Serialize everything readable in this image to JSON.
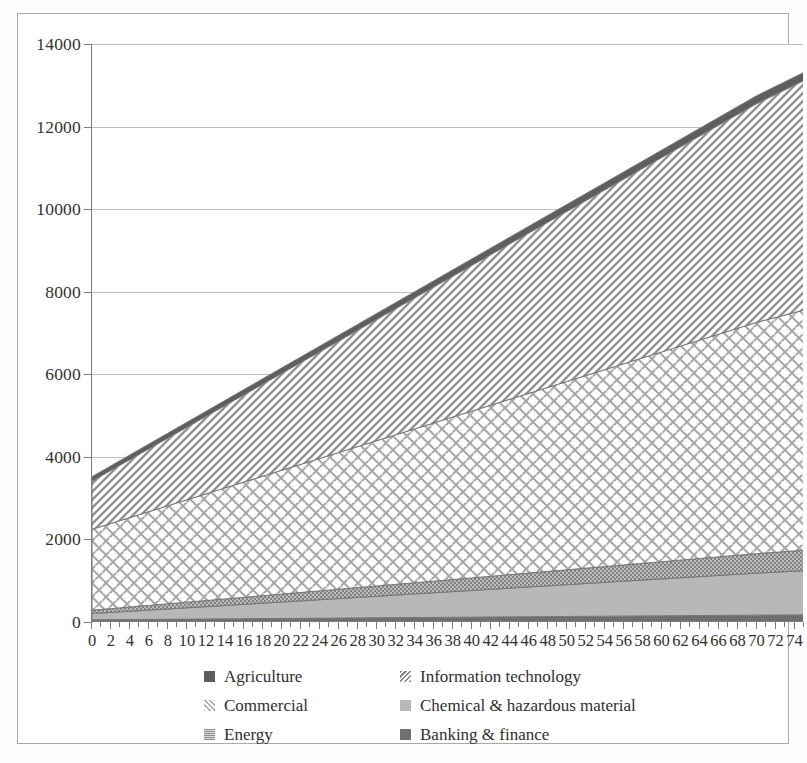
{
  "chart_data": {
    "type": "area",
    "title": "",
    "xlabel": "",
    "ylabel": "",
    "stacked": true,
    "grid": true,
    "legend_position": "bottom",
    "xlim": [
      0,
      75
    ],
    "ylim": [
      0,
      14000
    ],
    "y_ticks": [
      0,
      2000,
      4000,
      6000,
      8000,
      10000,
      12000,
      14000
    ],
    "x_ticks": [
      0,
      2,
      4,
      6,
      8,
      10,
      12,
      14,
      16,
      18,
      20,
      22,
      24,
      26,
      28,
      30,
      32,
      34,
      36,
      38,
      40,
      42,
      44,
      46,
      48,
      50,
      52,
      54,
      56,
      58,
      60,
      62,
      64,
      66,
      68,
      70,
      72,
      74
    ],
    "x": [
      0,
      5,
      10,
      15,
      20,
      25,
      30,
      35,
      40,
      45,
      50,
      55,
      60,
      65,
      70,
      75
    ],
    "series": [
      {
        "name": "Banking & finance",
        "pattern": "solid-dark",
        "color": "#6f6f71",
        "values": [
          55,
          62,
          70,
          78,
          86,
          94,
          102,
          110,
          118,
          126,
          134,
          142,
          150,
          158,
          166,
          172
        ]
      },
      {
        "name": "Chemical & hazardous material",
        "pattern": "solid-light",
        "color": "#b8b8ba",
        "values": [
          150,
          212,
          274,
          336,
          398,
          460,
          522,
          584,
          646,
          708,
          770,
          832,
          894,
          956,
          1018,
          1070
        ]
      },
      {
        "name": "Energy",
        "pattern": "fine-dots",
        "color": "#8d8d8f",
        "values": [
          80,
          108,
          136,
          164,
          192,
          220,
          248,
          276,
          304,
          332,
          360,
          388,
          416,
          444,
          472,
          495
        ]
      },
      {
        "name": "Commercial",
        "pattern": "basketweave",
        "color": "#9a9a9c",
        "values": [
          1960,
          2220,
          2480,
          2740,
          3000,
          3260,
          3520,
          3780,
          4040,
          4300,
          4560,
          4820,
          5080,
          5340,
          5600,
          5820
        ]
      },
      {
        "name": "Information technology",
        "pattern": "diagonal-hatch",
        "color": "#888889",
        "values": [
          1170,
          1465,
          1760,
          2055,
          2350,
          2645,
          2940,
          3235,
          3530,
          3825,
          4120,
          4415,
          4710,
          5005,
          5300,
          5560
        ]
      },
      {
        "name": "Agriculture",
        "pattern": "solid-darkest",
        "color": "#5e5e60",
        "values": [
          105,
          112,
          118,
          124,
          130,
          136,
          142,
          148,
          154,
          160,
          166,
          172,
          178,
          184,
          190,
          195
        ]
      }
    ],
    "stack_totals": [
      3520,
      4179,
      4838,
      5497,
      6156,
      6815,
      7474,
      8133,
      8792,
      9451,
      10110,
      10769,
      11428,
      12087,
      12746,
      13312
    ]
  },
  "legend": {
    "items": [
      {
        "label": "Agriculture",
        "swatch": "solid-darkest"
      },
      {
        "label": "Information technology",
        "swatch": "diagonal-hatch"
      },
      {
        "label": "Commercial",
        "swatch": "basketweave"
      },
      {
        "label": "Chemical & hazardous material",
        "swatch": "solid-light"
      },
      {
        "label": "Energy",
        "swatch": "fine-dots"
      },
      {
        "label": "Banking & finance",
        "swatch": "solid-dark"
      }
    ]
  }
}
